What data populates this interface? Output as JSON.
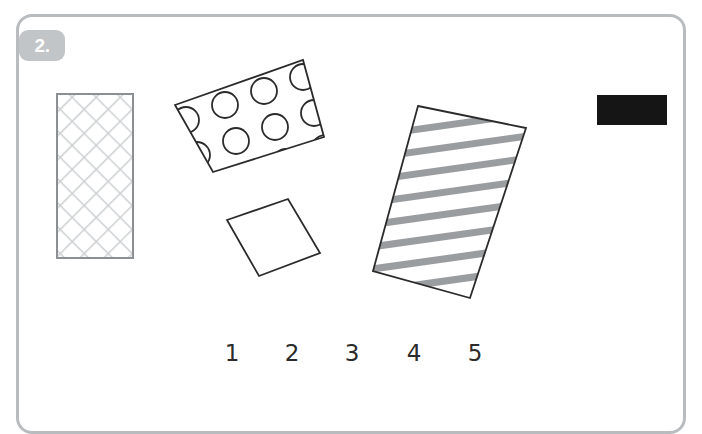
{
  "panel": {
    "exercise_number": "2.",
    "border_color": "#b9bcbe",
    "badge_color": "#c2c5c7",
    "background_color": "#ffffff"
  },
  "figures": [
    {
      "name": "crosshatch-rectangle",
      "pattern": "cross-hatch",
      "fill_color": "#ffffff",
      "pattern_color": "#cfd2d4",
      "outline_color": "#8d9093",
      "rotation_deg": 0,
      "x": 57,
      "y": 94,
      "width": 76,
      "height": 164
    },
    {
      "name": "polka-dot-rectangle",
      "pattern": "polka-dots",
      "fill_color": "#ffffff",
      "pattern_color": "#2b2b2b",
      "outline_color": "#2b2b2b",
      "rotation_deg": -16,
      "dot_count": 12,
      "corners": [
        [
          175,
          105
        ],
        [
          303,
          60
        ],
        [
          324,
          137
        ],
        [
          213,
          172
        ]
      ]
    },
    {
      "name": "plain-rectangle",
      "pattern": "plain",
      "fill_color": "#ffffff",
      "outline_color": "#2b2b2b",
      "rotation_deg": -19,
      "corners": [
        [
          227,
          220
        ],
        [
          288,
          199
        ],
        [
          320,
          253
        ],
        [
          259,
          276
        ]
      ]
    },
    {
      "name": "striped-rectangle",
      "pattern": "horizontal-stripes",
      "fill_color": "#ffffff",
      "pattern_color": "#9a9d9f",
      "outline_color": "#2b2b2b",
      "rotation_deg": -8,
      "stripe_count": 8,
      "corners": [
        [
          418,
          106
        ],
        [
          526,
          128
        ],
        [
          470,
          298
        ],
        [
          373,
          271
        ]
      ]
    },
    {
      "name": "solid-black-rectangle",
      "pattern": "solid",
      "fill_color": "#151515",
      "outline_color": "#151515",
      "rotation_deg": 0,
      "x": 597,
      "y": 95,
      "width": 70,
      "height": 30
    }
  ],
  "number_labels": [
    {
      "id": "1",
      "text": "1"
    },
    {
      "id": "2",
      "text": "2"
    },
    {
      "id": "3",
      "text": "3"
    },
    {
      "id": "4",
      "text": "4"
    },
    {
      "id": "5",
      "text": "5"
    }
  ]
}
